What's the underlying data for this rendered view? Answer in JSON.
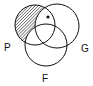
{
  "diagram": {
    "type": "venn",
    "sets": [
      {
        "label": "P",
        "cx": 35,
        "cy": 25,
        "r": 20
      },
      {
        "label": "G",
        "cx": 57,
        "cy": 26,
        "r": 22
      },
      {
        "label": "F",
        "cx": 46,
        "cy": 45,
        "r": 21
      }
    ],
    "shaded_region": "P only (not G, not F)",
    "dot": {
      "cx": 48,
      "cy": 17,
      "region": "P and G, not F"
    },
    "colors": {
      "stroke": "#111111",
      "hatch": "#222222",
      "background": "#ffffff"
    }
  },
  "labels": {
    "p": "P",
    "g": "G",
    "f": "F"
  }
}
